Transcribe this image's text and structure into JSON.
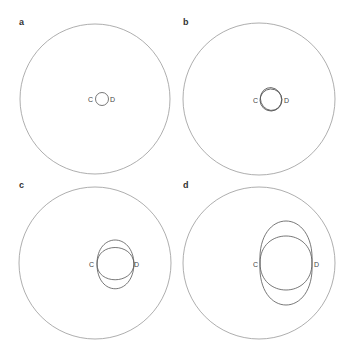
{
  "figure": {
    "stroke_color": "#888888",
    "inner_stroke_color": "#555555",
    "panels": [
      {
        "label": "a",
        "point_c": "C",
        "point_d": "D"
      },
      {
        "label": "b",
        "point_c": "C",
        "point_d": "D"
      },
      {
        "label": "c",
        "point_c": "C",
        "point_d": "D"
      },
      {
        "label": "d",
        "point_c": "C",
        "point_d": "D"
      }
    ]
  }
}
